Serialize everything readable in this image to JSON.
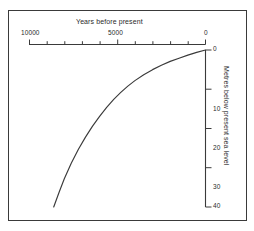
{
  "chart_data": {
    "type": "line",
    "title": "",
    "xlabel": "Years before present",
    "ylabel": "Metres below present sea level",
    "xlim": [
      10000,
      0
    ],
    "ylim": [
      0,
      40
    ],
    "x_ticks": [
      10000,
      9000,
      8000,
      7000,
      6000,
      5000,
      4000,
      3000,
      2000,
      1000,
      0
    ],
    "x_tick_labels": [
      "10000",
      "",
      "",
      "",
      "",
      "5000",
      "",
      "",
      "",
      "",
      "0"
    ],
    "x_major_labels": [
      "10000",
      "5000",
      "0"
    ],
    "y_ticks": [
      0,
      10,
      20,
      30,
      40
    ],
    "y_tick_labels": [
      "0",
      "10",
      "20",
      "30",
      "40"
    ],
    "x_axis_position": "top",
    "y_axis_position": "right",
    "y_axis_inverted": true,
    "grid": false,
    "legend": false,
    "series": [
      {
        "name": "Sea level rise",
        "x": [
          8600,
          8300,
          8000,
          7600,
          7200,
          6800,
          6400,
          6000,
          5600,
          5200,
          4800,
          4400,
          4000,
          3500,
          3000,
          2500,
          2000,
          1500,
          1000,
          500,
          0
        ],
        "values": [
          40.0,
          36.3,
          32.8,
          28.8,
          25.3,
          22.2,
          19.4,
          16.9,
          14.6,
          12.6,
          10.8,
          9.2,
          7.8,
          6.3,
          5.0,
          3.9,
          2.9,
          2.1,
          1.3,
          0.6,
          0.0
        ]
      }
    ],
    "curve_color": "#3a3a3a",
    "axis_color": "#3a3a3a",
    "frame_color": "#3a3a3a",
    "background_color": "#ffffff"
  },
  "axes": {
    "x_title": "Years before present",
    "y_title": "Metres below present sea level",
    "x_labels": {
      "left": "10000",
      "middle": "5000",
      "right": "0"
    },
    "y_labels": {
      "t0": "0",
      "t10": "10",
      "t20": "20",
      "t30": "30",
      "t40": "40"
    }
  }
}
